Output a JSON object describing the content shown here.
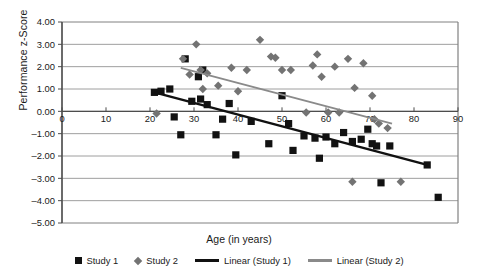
{
  "chart_data": {
    "type": "scatter",
    "title": "",
    "xlabel": "Age (in years)",
    "ylabel": "Performance z-Score",
    "xlim": [
      0,
      90
    ],
    "ylim": [
      -5.0,
      4.0
    ],
    "xticks": [
      "0",
      "10",
      "20",
      "30",
      "40",
      "50",
      "60",
      "70",
      "80",
      "90"
    ],
    "yticks": [
      "4.00",
      "3.00",
      "2.00",
      "1.00",
      "0.00",
      "-1.00",
      "-2.00",
      "-3.00",
      "-4.00",
      "-5.00"
    ],
    "grid": true,
    "legend_position": "bottom",
    "series": [
      {
        "name": "Study 1",
        "marker": "square",
        "color": "#121212",
        "points": [
          [
            21.0,
            0.85
          ],
          [
            22.5,
            0.9
          ],
          [
            24.5,
            1.0
          ],
          [
            25.5,
            -0.25
          ],
          [
            27.0,
            -1.05
          ],
          [
            28.0,
            2.35
          ],
          [
            29.5,
            0.45
          ],
          [
            31.0,
            1.55
          ],
          [
            31.5,
            0.55
          ],
          [
            32.0,
            1.85
          ],
          [
            33.0,
            0.3
          ],
          [
            35.0,
            -1.05
          ],
          [
            36.5,
            -0.35
          ],
          [
            38.0,
            0.35
          ],
          [
            39.5,
            -1.95
          ],
          [
            43.0,
            -0.45
          ],
          [
            47.0,
            -1.45
          ],
          [
            50.0,
            0.7
          ],
          [
            51.5,
            -0.55
          ],
          [
            52.5,
            -1.75
          ],
          [
            55.0,
            -1.1
          ],
          [
            57.5,
            -1.2
          ],
          [
            58.5,
            -2.1
          ],
          [
            60.0,
            -1.15
          ],
          [
            62.0,
            -1.45
          ],
          [
            64.0,
            -0.95
          ],
          [
            66.0,
            -1.35
          ],
          [
            68.0,
            -1.25
          ],
          [
            69.5,
            -0.8
          ],
          [
            70.5,
            -1.45
          ],
          [
            71.5,
            -1.55
          ],
          [
            72.5,
            -3.2
          ],
          [
            74.5,
            -1.55
          ],
          [
            83.0,
            -2.4
          ],
          [
            85.5,
            -3.85
          ]
        ]
      },
      {
        "name": "Study 2",
        "marker": "diamond",
        "color": "#737373",
        "points": [
          [
            21.5,
            -0.1
          ],
          [
            27.5,
            2.35
          ],
          [
            29.0,
            1.65
          ],
          [
            30.5,
            3.0
          ],
          [
            31.5,
            1.85
          ],
          [
            32.0,
            1.0
          ],
          [
            33.0,
            1.7
          ],
          [
            35.5,
            1.15
          ],
          [
            38.5,
            1.95
          ],
          [
            40.0,
            0.9
          ],
          [
            42.0,
            1.85
          ],
          [
            45.0,
            3.2
          ],
          [
            47.5,
            2.45
          ],
          [
            48.5,
            2.4
          ],
          [
            52.0,
            1.85
          ],
          [
            55.5,
            -0.05
          ],
          [
            57.0,
            2.05
          ],
          [
            58.0,
            2.55
          ],
          [
            59.0,
            1.55
          ],
          [
            60.5,
            -0.05
          ],
          [
            62.0,
            2.0
          ],
          [
            63.0,
            -0.05
          ],
          [
            65.0,
            2.35
          ],
          [
            66.5,
            1.05
          ],
          [
            68.5,
            2.15
          ],
          [
            70.5,
            0.7
          ],
          [
            71.0,
            -0.35
          ],
          [
            72.0,
            -0.55
          ],
          [
            74.0,
            -0.75
          ],
          [
            66.0,
            -3.15
          ],
          [
            77.0,
            -3.15
          ],
          [
            50.0,
            1.85
          ]
        ]
      }
    ],
    "trendlines": [
      {
        "name": "Linear (Study 1)",
        "color": "#111111",
        "x_start": 21.0,
        "y_start": 0.85,
        "x_end": 83.0,
        "y_end": -2.4
      },
      {
        "name": "Linear (Study 2)",
        "color": "#8a8a8a",
        "x_start": 27.0,
        "y_start": 1.95,
        "x_end": 75.0,
        "y_end": -0.55
      }
    ]
  },
  "legend": {
    "items": [
      {
        "label": "Study 1",
        "swatch": "square-marker-icon"
      },
      {
        "label": "Study 2",
        "swatch": "diamond-marker-icon"
      },
      {
        "label": "Linear (Study 1)",
        "swatch": "dark-line-icon"
      },
      {
        "label": "Linear (Study 2)",
        "swatch": "gray-line-icon"
      }
    ]
  },
  "colors": {
    "study1": "#121212",
    "study2": "#737373",
    "trend1": "#111111",
    "trend2": "#8a8a8a",
    "grid": "#9e9e9e",
    "axis": "#4d4d4d",
    "frame": "#808080"
  }
}
